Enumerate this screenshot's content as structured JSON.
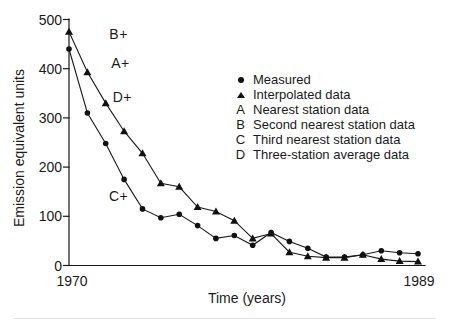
{
  "chart_data": {
    "type": "line",
    "title": "",
    "xlabel": "Time (years)",
    "ylabel": "Emission equivalent units",
    "xlim": [
      1970,
      1989
    ],
    "ylim": [
      0,
      500
    ],
    "grid": false,
    "x_tick_labels": [
      "1970",
      "1989"
    ],
    "y_ticks": [
      0,
      100,
      200,
      300,
      400,
      500
    ],
    "years": [
      1970,
      1971,
      1972,
      1973,
      1974,
      1975,
      1976,
      1977,
      1978,
      1979,
      1980,
      1981,
      1982,
      1983,
      1984,
      1985,
      1986,
      1987,
      1988,
      1989
    ],
    "series": [
      {
        "name": "Measured",
        "marker": "circle",
        "values": [
          440,
          310,
          248,
          175,
          115,
          97,
          104,
          81,
          55,
          61,
          41,
          67,
          49,
          35,
          17,
          17,
          22,
          30,
          26,
          24
        ]
      },
      {
        "name": "Interpolated data",
        "marker": "triangle",
        "values": [
          475,
          393,
          330,
          273,
          228,
          167,
          160,
          119,
          110,
          91,
          55,
          65,
          27,
          19,
          16,
          16,
          22,
          13,
          9,
          8
        ]
      }
    ],
    "annotations": [
      {
        "label": "B+",
        "x": 1972.7,
        "y": 470
      },
      {
        "label": "A+",
        "x": 1972.8,
        "y": 411
      },
      {
        "label": "D+",
        "x": 1972.9,
        "y": 342
      },
      {
        "label": "C+",
        "x": 1972.7,
        "y": 141
      }
    ],
    "legend": {
      "position": "right",
      "items": [
        {
          "marker": "circle",
          "label": "Measured"
        },
        {
          "marker": "triangle",
          "label": "Interpolated data"
        },
        {
          "marker": "A",
          "label": "Nearest station data"
        },
        {
          "marker": "B",
          "label": "Second nearest station data"
        },
        {
          "marker": "C",
          "label": "Third nearest station data"
        },
        {
          "marker": "D",
          "label": "Three-station average data"
        }
      ]
    },
    "colors": {
      "line": "#1a1a1a",
      "text": "#1a1a1a",
      "background": "#ffffff"
    }
  }
}
